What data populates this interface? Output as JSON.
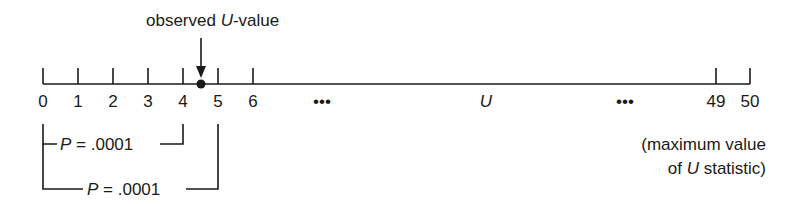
{
  "diagram": {
    "observed_label": {
      "prefix": "observed ",
      "var": "U",
      "suffix": "-value"
    },
    "observed_value": 4.5,
    "axis": {
      "ticks": [
        "0",
        "1",
        "2",
        "3",
        "4",
        "5",
        "6",
        "49",
        "50"
      ],
      "ellipsis_left": "•••",
      "variable": "U",
      "ellipsis_right": "•••"
    },
    "brackets": [
      {
        "from": 0,
        "to": 4,
        "label": "P = .0001",
        "p_symbol": "P",
        "p_rest": " = .0001"
      },
      {
        "from": 0,
        "to": 5,
        "label": "P = .0001",
        "p_symbol": "P",
        "p_rest": " = .0001"
      }
    ],
    "max_note": {
      "line1": "(maximum value",
      "line2_prefix": "of ",
      "line2_var": "U",
      "line2_suffix": " statistic)"
    }
  }
}
